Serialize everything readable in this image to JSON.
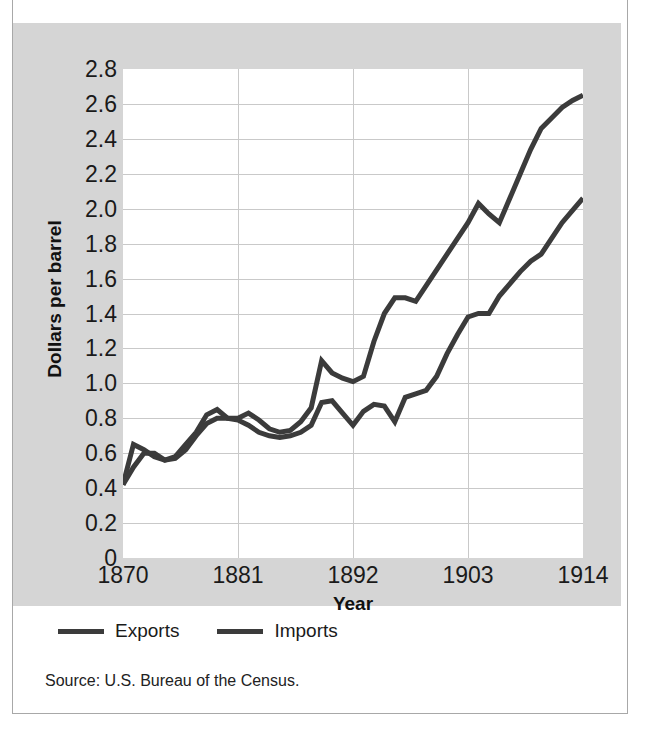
{
  "figure": {
    "panel_bg": "#d5d5d5",
    "plot_bg": "#ffffff",
    "line_color": "#3b3b3b",
    "grid_color": "#c9c9c9"
  },
  "axes": {
    "y_title": "Dollars per barrel",
    "x_title": "Year",
    "y_ticks": [
      "2.8",
      "2.6",
      "2.4",
      "2.2",
      "2.0",
      "1.8",
      "1.6",
      "1.4",
      "1.2",
      "1.0",
      "0.8",
      "0.6",
      "0.4",
      "0.2",
      "0"
    ],
    "x_ticks": [
      "1870",
      "1881",
      "1892",
      "1903",
      "1914"
    ]
  },
  "legend": {
    "items": [
      {
        "label": "Exports",
        "color": "#3b3b3b"
      },
      {
        "label": "Imports",
        "color": "#3b3b3b"
      }
    ]
  },
  "source": {
    "text": "Source: U.S. Bureau of the Census."
  },
  "chart_data": {
    "type": "line",
    "title": "",
    "xlabel": "Year",
    "ylabel": "Dollars per barrel",
    "xlim": [
      1870,
      1914
    ],
    "ylim": [
      0,
      2.8
    ],
    "ytick_step": 0.2,
    "grid": true,
    "legend_position": "below-plot",
    "x": [
      1870,
      1871,
      1872,
      1873,
      1874,
      1875,
      1876,
      1877,
      1878,
      1879,
      1880,
      1881,
      1882,
      1883,
      1884,
      1885,
      1886,
      1887,
      1888,
      1889,
      1890,
      1891,
      1892,
      1893,
      1894,
      1895,
      1896,
      1897,
      1898,
      1899,
      1900,
      1901,
      1902,
      1903,
      1904,
      1905,
      1906,
      1907,
      1908,
      1909,
      1910,
      1911,
      1912,
      1913,
      1914
    ],
    "series": [
      {
        "name": "Exports",
        "color": "#3b3b3b",
        "values": [
          0.42,
          0.65,
          0.62,
          0.58,
          0.56,
          0.58,
          0.65,
          0.72,
          0.82,
          0.85,
          0.8,
          0.8,
          0.83,
          0.79,
          0.74,
          0.72,
          0.73,
          0.78,
          0.86,
          1.13,
          1.06,
          1.03,
          1.01,
          1.04,
          1.24,
          1.4,
          1.49,
          1.49,
          1.47,
          1.56,
          1.65,
          1.74,
          1.83,
          1.92,
          2.03,
          1.97,
          1.92,
          2.06,
          2.2,
          2.34,
          2.46,
          2.52,
          2.58,
          2.62,
          2.65
        ]
      },
      {
        "name": "Imports",
        "color": "#3b3b3b",
        "values": [
          0.42,
          0.52,
          0.6,
          0.6,
          0.56,
          0.57,
          0.62,
          0.7,
          0.77,
          0.8,
          0.8,
          0.79,
          0.76,
          0.72,
          0.7,
          0.69,
          0.7,
          0.72,
          0.76,
          0.89,
          0.9,
          0.83,
          0.76,
          0.84,
          0.88,
          0.87,
          0.78,
          0.92,
          0.94,
          0.96,
          1.04,
          1.17,
          1.28,
          1.38,
          1.4,
          1.4,
          1.5,
          1.57,
          1.64,
          1.7,
          1.74,
          1.83,
          1.92,
          1.99,
          2.06
        ]
      }
    ]
  }
}
